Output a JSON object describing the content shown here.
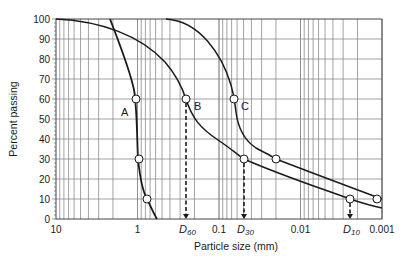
{
  "chart_data": {
    "type": "line",
    "title": "",
    "xlabel": "Particle size (mm)",
    "ylabel": "Percent passing",
    "x_scale": "log",
    "x_reversed": true,
    "xlim": [
      10,
      0.001
    ],
    "ylim": [
      0,
      100
    ],
    "x_tick_labels": [
      "10",
      "1",
      "0.1",
      "0.01",
      "0.001"
    ],
    "y_tick_labels": [
      "0",
      "10",
      "20",
      "30",
      "40",
      "50",
      "60",
      "70",
      "80",
      "90",
      "100"
    ],
    "grid": true,
    "series": [
      {
        "name": "A",
        "label_pos": "left of 60% point",
        "points": [
          {
            "size_mm": 2.9,
            "percent": 100
          },
          {
            "size_mm": 1.6,
            "percent": 85
          },
          {
            "size_mm": 1.05,
            "percent": 60
          },
          {
            "size_mm": 0.97,
            "percent": 30
          },
          {
            "size_mm": 0.76,
            "percent": 10
          },
          {
            "size_mm": 0.57,
            "percent": 0
          }
        ],
        "marked_points": [
          {
            "size_mm": 1.05,
            "percent": 60
          },
          {
            "size_mm": 0.97,
            "percent": 30
          },
          {
            "size_mm": 0.76,
            "percent": 10
          }
        ]
      },
      {
        "name": "B",
        "label_pos": "right of 60% point",
        "points": [
          {
            "size_mm": 10,
            "percent": 100
          },
          {
            "size_mm": 2.5,
            "percent": 94
          },
          {
            "size_mm": 0.6,
            "percent": 75
          },
          {
            "size_mm": 0.26,
            "percent": 60
          },
          {
            "size_mm": 0.17,
            "percent": 48
          },
          {
            "size_mm": 0.05,
            "percent": 30
          },
          {
            "size_mm": 0.01,
            "percent": 20
          },
          {
            "size_mm": 0.0025,
            "percent": 10
          },
          {
            "size_mm": 0.001,
            "percent": 5
          }
        ],
        "marked_points": [
          {
            "size_mm": 0.26,
            "percent": 60
          },
          {
            "size_mm": 0.05,
            "percent": 30
          },
          {
            "size_mm": 0.0025,
            "percent": 10
          }
        ]
      },
      {
        "name": "C",
        "label_pos": "right of 60% point",
        "points": [
          {
            "size_mm": 0.72,
            "percent": 100
          },
          {
            "size_mm": 0.25,
            "percent": 90
          },
          {
            "size_mm": 0.1,
            "percent": 75
          },
          {
            "size_mm": 0.066,
            "percent": 60
          },
          {
            "size_mm": 0.055,
            "percent": 45
          },
          {
            "size_mm": 0.02,
            "percent": 30
          },
          {
            "size_mm": 0.005,
            "percent": 20
          },
          {
            "size_mm": 0.0011,
            "percent": 10
          }
        ],
        "marked_points": [
          {
            "size_mm": 0.066,
            "percent": 60
          },
          {
            "size_mm": 0.02,
            "percent": 30
          },
          {
            "size_mm": 0.0011,
            "percent": 10
          }
        ]
      }
    ],
    "annotations": [
      {
        "text": "D60",
        "base": "D",
        "sub": "60",
        "size_mm": 0.26,
        "from_percent": 60,
        "style": "dashed arrow to x-axis"
      },
      {
        "text": "D30",
        "base": "D",
        "sub": "30",
        "size_mm": 0.05,
        "from_percent": 30,
        "style": "dashed arrow to x-axis"
      },
      {
        "text": "D10",
        "base": "D",
        "sub": "10",
        "size_mm": 0.0025,
        "from_percent": 10,
        "style": "dashed arrow to x-axis"
      }
    ],
    "legend": "none (curves labelled A, B, C inline)"
  },
  "labels": {
    "xlabel": "Particle size (mm)",
    "ylabel": "Percent passing",
    "curve_a": "A",
    "curve_b": "B",
    "curve_c": "C",
    "d60_base": "D",
    "d60_sub": "60",
    "d30_base": "D",
    "d30_sub": "30",
    "d10_base": "D",
    "d10_sub": "10",
    "x_ticks": [
      "10",
      "1",
      "0.1",
      "0.01",
      "0.001"
    ],
    "y_ticks": [
      "0",
      "10",
      "20",
      "30",
      "40",
      "50",
      "60",
      "70",
      "80",
      "90",
      "100"
    ]
  },
  "colors": {
    "curve": "#1a1a1a",
    "grid": "#8a8a8a",
    "background": "#ffffff"
  }
}
